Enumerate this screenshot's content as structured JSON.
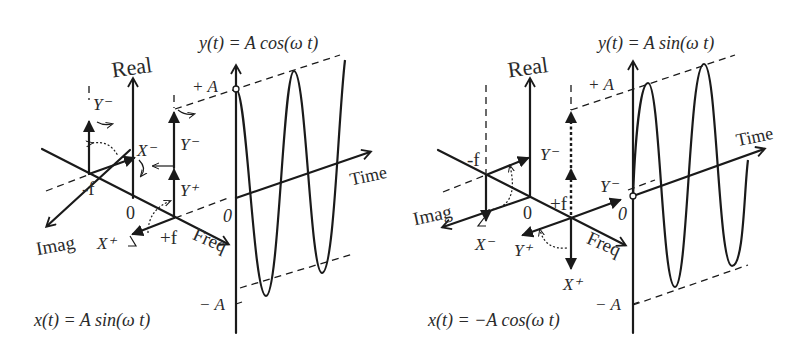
{
  "panels": [
    {
      "id": "left",
      "y_equation": "y(t) = A cos(ω t)",
      "x_equation": "x(t) = A sin(ω t)",
      "axis_labels": {
        "real": "Real",
        "imag": "Imag",
        "freq": "Freq",
        "time": "Time"
      },
      "freq_marks": {
        "neg": "-f",
        "pos": "+f",
        "origin": "0"
      },
      "amplitude_labels": {
        "pos": "+ A",
        "neg": "− A",
        "zero": "0"
      },
      "phasor_labels": {
        "neg_top": "Y⁻",
        "neg_x": "X⁻",
        "pos_top": "Y⁻",
        "pos_y": "Y⁺",
        "pos_x": "X⁺"
      }
    },
    {
      "id": "right",
      "y_equation": "y(t) = A sin(ω t)",
      "x_equation": "x(t) = −A cos(ω t)",
      "axis_labels": {
        "real": "Real",
        "imag": "Imag",
        "freq": "Freq",
        "time": "Time"
      },
      "freq_marks": {
        "neg": "-f",
        "pos": "+f",
        "origin": "0"
      },
      "amplitude_labels": {
        "pos": "+ A",
        "neg": "− A",
        "zero": "0"
      },
      "phasor_labels": {
        "neg_y": "Y⁻",
        "neg_x": "X⁻",
        "pos_y_minus": "Y⁻",
        "pos_y_plus": "Y⁺",
        "pos_x": "X⁺"
      }
    }
  ]
}
